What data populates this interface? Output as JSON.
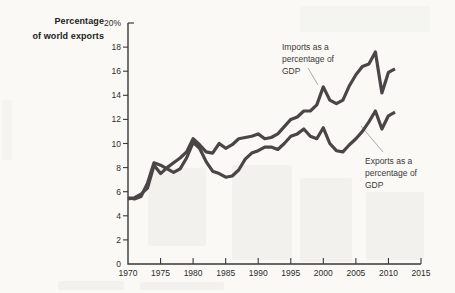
{
  "figure": {
    "y_axis_title": "Percentage\nof world exports",
    "labels": {
      "imports": "Imports as a\npercentage of\nGDP",
      "exports": "Exports as a\npercentage of\nGDP"
    },
    "colors": {
      "line": "#4a4546",
      "axis": "#3a3938",
      "tick_text": "#2e2d2b",
      "leader": "#aba9a4"
    }
  },
  "chart_data": {
    "type": "line",
    "title": "",
    "ylabel": "Percentage of world exports",
    "xlabel": "",
    "xlim": [
      1970,
      2015
    ],
    "ylim": [
      0,
      20
    ],
    "grid": false,
    "legend_position": "inline-annotations",
    "x_ticks": [
      1970,
      1975,
      1980,
      1985,
      1990,
      1995,
      2000,
      2005,
      2010,
      2015
    ],
    "x_tick_labels": [
      "1970",
      "1975",
      "1980",
      "1985",
      "1990",
      "1995",
      "2000",
      "2005",
      "2010",
      "2015"
    ],
    "y_ticks": [
      0,
      2,
      4,
      6,
      8,
      10,
      12,
      14,
      16,
      18,
      20
    ],
    "y_tick_labels": [
      "0",
      "2",
      "4",
      "6",
      "8",
      "10",
      "12",
      "14",
      "16",
      "18",
      "20%"
    ],
    "x": [
      1970,
      1971,
      1972,
      1973,
      1974,
      1975,
      1976,
      1977,
      1978,
      1979,
      1980,
      1981,
      1982,
      1983,
      1984,
      1985,
      1986,
      1987,
      1988,
      1989,
      1990,
      1991,
      1992,
      1993,
      1994,
      1995,
      1996,
      1997,
      1998,
      1999,
      2000,
      2001,
      2002,
      2003,
      2004,
      2005,
      2006,
      2007,
      2008,
      2009,
      2010,
      2011
    ],
    "series": [
      {
        "name": "Imports as a percentage of GDP",
        "values": [
          5.4,
          5.5,
          5.8,
          6.3,
          8.2,
          7.5,
          8.0,
          8.4,
          8.8,
          9.3,
          10.4,
          9.9,
          9.3,
          9.2,
          10.0,
          9.6,
          9.9,
          10.4,
          10.5,
          10.6,
          10.8,
          10.4,
          10.5,
          10.8,
          11.4,
          12.0,
          12.2,
          12.7,
          12.7,
          13.2,
          14.7,
          13.6,
          13.3,
          13.6,
          14.8,
          15.7,
          16.4,
          16.6,
          17.6,
          14.2,
          15.9,
          16.2
        ]
      },
      {
        "name": "Exports as a percentage of GDP",
        "values": [
          5.5,
          5.4,
          5.6,
          6.7,
          8.4,
          8.2,
          7.9,
          7.6,
          7.9,
          8.8,
          10.1,
          9.6,
          8.5,
          7.7,
          7.5,
          7.2,
          7.3,
          7.8,
          8.7,
          9.2,
          9.4,
          9.7,
          9.7,
          9.5,
          10.0,
          10.6,
          10.8,
          11.2,
          10.6,
          10.4,
          11.3,
          10.0,
          9.4,
          9.3,
          9.9,
          10.4,
          11.0,
          11.8,
          12.7,
          11.2,
          12.3,
          12.6
        ]
      }
    ]
  }
}
